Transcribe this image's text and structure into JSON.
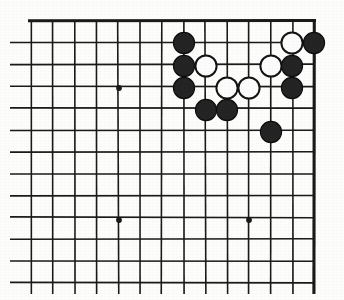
{
  "figure": {
    "board_size": 19,
    "view": "top-right corner section",
    "background_color": "#fdfdfb",
    "line_color": "#1a1a1a"
  },
  "geometry": {
    "width": 344,
    "height": 300,
    "origin_x": 31,
    "origin_y": 21,
    "spacing": 21.8,
    "columns_visible": 14,
    "rows_visible": 13,
    "top_edge_y": 21,
    "right_edge_x": 314,
    "left_clipped": true,
    "bottom_clipped": true,
    "stone_radius": 10.6
  },
  "star_points": [
    {
      "name": "star-point-left-upper",
      "col": 4,
      "row": 3,
      "x": 119,
      "y": 88
    },
    {
      "name": "star-point-left-lower",
      "col": 4,
      "row": 9,
      "x": 119,
      "y": 220
    },
    {
      "name": "star-point-center-lower",
      "col": 10,
      "row": 9,
      "x": 249,
      "y": 220
    }
  ],
  "stones": [
    {
      "id": "b1",
      "color": "black",
      "x": 184,
      "y": 43,
      "col": 7,
      "row": 1
    },
    {
      "id": "w1",
      "color": "white",
      "x": 292,
      "y": 43,
      "col": 12,
      "row": 1
    },
    {
      "id": "b2",
      "color": "black",
      "x": 314,
      "y": 43,
      "col": 13,
      "row": 1
    },
    {
      "id": "b3",
      "color": "black",
      "x": 184,
      "y": 66,
      "col": 7,
      "row": 2
    },
    {
      "id": "w2",
      "color": "white",
      "x": 206,
      "y": 66,
      "col": 8,
      "row": 2
    },
    {
      "id": "w3",
      "color": "white",
      "x": 271,
      "y": 66,
      "col": 11,
      "row": 2
    },
    {
      "id": "b4",
      "color": "black",
      "x": 292,
      "y": 66,
      "col": 12,
      "row": 2
    },
    {
      "id": "b5",
      "color": "black",
      "x": 184,
      "y": 88,
      "col": 7,
      "row": 3
    },
    {
      "id": "w4",
      "color": "white",
      "x": 227,
      "y": 88,
      "col": 9,
      "row": 3
    },
    {
      "id": "w5",
      "color": "white",
      "x": 249,
      "y": 88,
      "col": 10,
      "row": 3
    },
    {
      "id": "b6",
      "color": "black",
      "x": 292,
      "y": 88,
      "col": 12,
      "row": 3
    },
    {
      "id": "b7",
      "color": "black",
      "x": 206,
      "y": 110,
      "col": 8,
      "row": 4
    },
    {
      "id": "b8",
      "color": "black",
      "x": 227,
      "y": 110,
      "col": 9,
      "row": 4
    },
    {
      "id": "b9",
      "color": "black",
      "x": 271,
      "y": 132,
      "col": 11,
      "row": 5
    }
  ],
  "counts": {
    "black_stones": 9,
    "white_stones": 5,
    "total_stones": 14
  },
  "colors": {
    "black_stone": "#242424",
    "white_stone": "#fcfcfc",
    "white_stone_outline": "#141414",
    "grid": "#1a1a1a",
    "board_bg": "#fdfdfb"
  }
}
